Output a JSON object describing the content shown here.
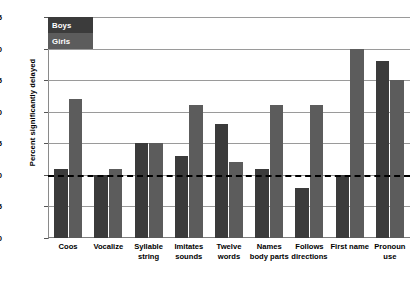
{
  "chart_data": {
    "type": "bar",
    "title": "",
    "xlabel": "",
    "ylabel": "Percent significantly delayed",
    "ylim": [
      0,
      35
    ],
    "yticks": [
      0,
      5,
      10,
      15,
      20,
      25,
      30,
      35
    ],
    "grid": true,
    "legend_position": "top-left",
    "categories": [
      "Coos",
      "Vocalize",
      "Syllable string",
      "Imitates sounds",
      "Twelve words",
      "Names body parts",
      "Follows directions",
      "First name",
      "Pronoun use"
    ],
    "series": [
      {
        "name": "Boys",
        "color": "#3b3b3b",
        "values": [
          11,
          10,
          15,
          13,
          18,
          11,
          8,
          10,
          28
        ]
      },
      {
        "name": "Girls",
        "color": "#5c5c5c",
        "values": [
          22,
          11,
          15,
          21,
          12,
          21,
          21,
          30,
          25
        ]
      }
    ],
    "reference_line": {
      "value": 10,
      "style": "dashed",
      "color": "#000000"
    }
  },
  "legend": {
    "items": [
      {
        "label": "Boys",
        "color": "#3b3b3b"
      },
      {
        "label": "Girls",
        "color": "#5c5c5c"
      }
    ]
  }
}
